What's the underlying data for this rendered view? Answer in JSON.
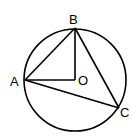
{
  "diagram": {
    "circle": {
      "center": "O",
      "cx": 75,
      "cy": 80,
      "r": 51
    },
    "points": {
      "A": {
        "label": "A",
        "x": 25,
        "y": 80
      },
      "B": {
        "label": "B",
        "x": 75,
        "y": 28
      },
      "C": {
        "label": "C",
        "x": 119,
        "y": 108
      },
      "O": {
        "label": "O",
        "x": 75,
        "y": 80
      }
    },
    "segments": [
      "AB",
      "BC",
      "CA",
      "AO",
      "BO"
    ],
    "colors": {
      "stroke": "#000000",
      "background": "#ffffff"
    }
  }
}
